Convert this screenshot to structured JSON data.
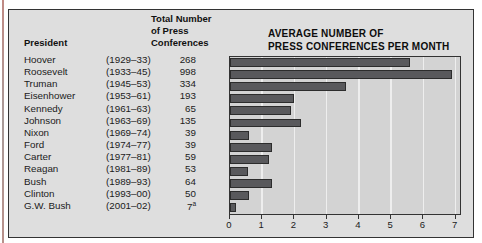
{
  "table": {
    "col_president": "President",
    "col_total": [
      "Total Number",
      "of Press",
      "Conferences"
    ],
    "rows": [
      {
        "name": "Hoover",
        "term": "(1929–33)",
        "total": "268",
        "sup": ""
      },
      {
        "name": "Roosevelt",
        "term": "(1933–45)",
        "total": "998",
        "sup": ""
      },
      {
        "name": "Truman",
        "term": "(1945–53)",
        "total": "334",
        "sup": ""
      },
      {
        "name": "Eisenhower",
        "term": "(1953–61)",
        "total": "193",
        "sup": ""
      },
      {
        "name": "Kennedy",
        "term": "(1961–63)",
        "total": "65",
        "sup": ""
      },
      {
        "name": "Johnson",
        "term": "(1963–69)",
        "total": "135",
        "sup": ""
      },
      {
        "name": "Nixon",
        "term": "(1969–74)",
        "total": "39",
        "sup": ""
      },
      {
        "name": "Ford",
        "term": "(1974–77)",
        "total": "39",
        "sup": ""
      },
      {
        "name": "Carter",
        "term": "(1977–81)",
        "total": "59",
        "sup": ""
      },
      {
        "name": "Reagan",
        "term": "(1981–89)",
        "total": "53",
        "sup": ""
      },
      {
        "name": "Bush",
        "term": "(1989–93)",
        "total": "64",
        "sup": ""
      },
      {
        "name": "Clinton",
        "term": "(1993–00)",
        "total": "50",
        "sup": ""
      },
      {
        "name": "G.W. Bush",
        "term": "(2001–02)",
        "total": "7",
        "sup": "a"
      }
    ]
  },
  "chart_data": {
    "type": "bar",
    "orientation": "horizontal",
    "title_lines": [
      "AVERAGE NUMBER OF",
      "PRESS CONFERENCES PER MONTH"
    ],
    "categories": [
      "Hoover",
      "Roosevelt",
      "Truman",
      "Eisenhower",
      "Kennedy",
      "Johnson",
      "Nixon",
      "Ford",
      "Carter",
      "Reagan",
      "Bush",
      "Clinton",
      "G.W. Bush"
    ],
    "values": [
      5.6,
      6.9,
      3.6,
      2.0,
      1.9,
      2.2,
      0.6,
      1.3,
      1.2,
      0.55,
      1.3,
      0.6,
      0.2
    ],
    "xlabel": "",
    "ylabel": "",
    "xticks": [
      0,
      1,
      2,
      3,
      4,
      5,
      6,
      7
    ],
    "xlim": [
      0,
      7.2
    ],
    "grid": true,
    "legend": "none",
    "colors": {
      "bar_fill": "#59595c",
      "bar_border": "#2c2c2c",
      "plot_bg": "#d3d3d3",
      "gridline": "#eeeeee",
      "panel_bg": "#dedede",
      "panel_border": "#333333",
      "page_edge": "#b8908a"
    }
  }
}
